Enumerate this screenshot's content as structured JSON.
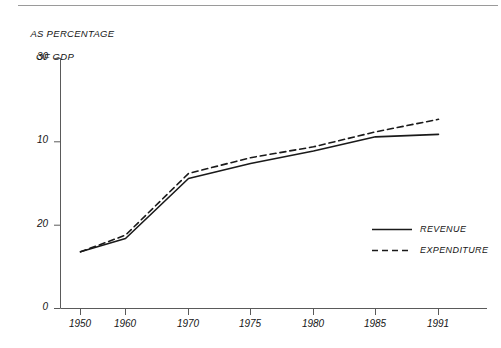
{
  "chart_data": {
    "type": "line",
    "title": "AS PERCENTAGE OF GDP",
    "title_line1": "AS PERCENTAGE",
    "title_line2": "OF GDP",
    "xlabel": "",
    "ylabel": "AS PERCENTAGE OF GDP",
    "categories": [
      "1950",
      "1960",
      "1970",
      "1975",
      "1980",
      "1985",
      "1991"
    ],
    "x": [
      1950,
      1960,
      1970,
      1975,
      1980,
      1985,
      1991
    ],
    "series": [
      {
        "name": "REVENUE",
        "style": "solid",
        "color": "#1a1a1a",
        "values": [
          6.8,
          8.4,
          15.6,
          17.4,
          18.9,
          20.6,
          20.9
        ]
      },
      {
        "name": "EXPENDITURE",
        "style": "dashed",
        "color": "#1a1a1a",
        "values": [
          6.8,
          8.8,
          16.2,
          18.1,
          19.4,
          21.2,
          22.7
        ]
      }
    ],
    "ylim": [
      0,
      30
    ],
    "yticks": [
      0,
      10,
      20,
      30
    ],
    "ytick_labels": [
      "0",
      "10",
      "20",
      "30"
    ],
    "grid": false,
    "legend_position": "inside-right"
  },
  "legend": {
    "items": [
      {
        "label": "REVENUE",
        "style": "solid"
      },
      {
        "label": "EXPENDITURE",
        "style": "dashed"
      }
    ]
  }
}
